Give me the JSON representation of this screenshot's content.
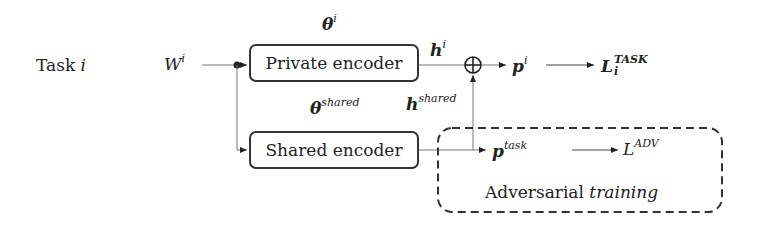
{
  "diagram": {
    "task_label": "Task",
    "task_var": "i",
    "input": {
      "base": "W",
      "sup": "i"
    },
    "private_encoder": {
      "label": "Private encoder",
      "param_base": "θ",
      "param_sup": "i"
    },
    "shared_encoder": {
      "label": "Shared encoder",
      "param_base": "θ",
      "param_sup": "shared"
    },
    "h_private": {
      "base": "h",
      "sup": "i"
    },
    "h_shared": {
      "base": "h",
      "sup": "shared"
    },
    "combine_symbol": "⊕",
    "p_private": {
      "base": "p",
      "sup": "i"
    },
    "loss_task": {
      "base": "L",
      "sup": "TASK",
      "sub": "i"
    },
    "p_task": {
      "base": "p",
      "sup": "task"
    },
    "loss_adv": {
      "base": "L",
      "sup": "ADV"
    },
    "adversarial_box": {
      "label": "Adversarial",
      "label_italic": "training"
    },
    "colors": {
      "line": "#333333",
      "thin_line": "#777777",
      "background": "#ffffff"
    }
  }
}
